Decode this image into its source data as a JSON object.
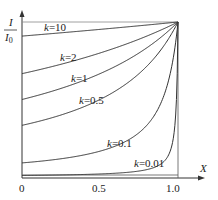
{
  "chart_data": {
    "type": "line",
    "title": "",
    "xlabel": "X",
    "ylabel": "I/I0",
    "ylabel_num": "I",
    "ylabel_den": "I",
    "ylabel_den_sub": "0",
    "xlim": [
      0,
      1.0
    ],
    "ylim": [
      0,
      1.0
    ],
    "x_ticks": [
      0,
      0.5,
      1.0
    ],
    "x_tick_labels": [
      "0",
      "0.5",
      "1.0"
    ],
    "grid": false,
    "legend": "inline labels",
    "formula_hint": "I/I0 = k / (k + 1 - X)",
    "x": [
      0,
      0.1,
      0.2,
      0.3,
      0.4,
      0.5,
      0.6,
      0.7,
      0.8,
      0.9,
      0.95,
      0.98,
      1.0
    ],
    "series": [
      {
        "name": "k=10",
        "label": "k=10",
        "k": 10,
        "values": [
          0.909,
          0.918,
          0.926,
          0.935,
          0.943,
          0.952,
          0.962,
          0.971,
          0.98,
          0.99,
          0.995,
          0.998,
          1.0
        ]
      },
      {
        "name": "k=2",
        "label": "k=2",
        "k": 2,
        "values": [
          0.667,
          0.69,
          0.714,
          0.741,
          0.769,
          0.8,
          0.833,
          0.87,
          0.909,
          0.952,
          0.976,
          0.99,
          1.0
        ]
      },
      {
        "name": "k=1",
        "label": "k=1",
        "k": 1,
        "values": [
          0.5,
          0.526,
          0.556,
          0.588,
          0.625,
          0.667,
          0.714,
          0.769,
          0.833,
          0.909,
          0.952,
          0.98,
          1.0
        ]
      },
      {
        "name": "k=0.5",
        "label": "k=0.5",
        "k": 0.5,
        "values": [
          0.333,
          0.357,
          0.385,
          0.417,
          0.455,
          0.5,
          0.556,
          0.625,
          0.714,
          0.833,
          0.909,
          0.962,
          1.0
        ]
      },
      {
        "name": "k=0.1",
        "label": "k=0.1",
        "k": 0.1,
        "values": [
          0.091,
          0.1,
          0.111,
          0.125,
          0.143,
          0.167,
          0.2,
          0.25,
          0.333,
          0.5,
          0.667,
          0.833,
          1.0
        ]
      },
      {
        "name": "k=0.01",
        "label": "k=0.01",
        "k": 0.01,
        "values": [
          0.01,
          0.011,
          0.012,
          0.014,
          0.016,
          0.02,
          0.024,
          0.032,
          0.048,
          0.091,
          0.167,
          0.333,
          1.0
        ]
      }
    ],
    "annotations": [
      "k=10",
      "k=2",
      "k=1",
      "k=0.5",
      "k=0.1",
      "k=0.01"
    ]
  }
}
